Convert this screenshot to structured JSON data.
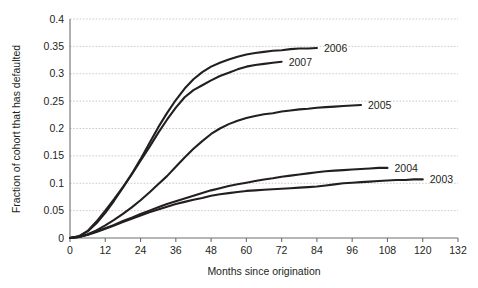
{
  "chart_data": {
    "type": "line",
    "title": "",
    "xlabel": "Months since origination",
    "ylabel": "Fraction of cohort that has defaulted",
    "xlim": [
      0,
      132
    ],
    "ylim": [
      0,
      0.4
    ],
    "xticks": [
      "0",
      "12",
      "24",
      "36",
      "48",
      "60",
      "72",
      "84",
      "96",
      "108",
      "120",
      "132"
    ],
    "yticks": [
      "0",
      "0.05",
      "0.1",
      "0.15",
      "0.2",
      "0.25",
      "0.3",
      "0.35",
      "0.4"
    ],
    "grid": "horizontal-dashed",
    "legend_position": "inline-right-of-line-end",
    "line_color": "#231f20",
    "grid_color": "#bdbdbd",
    "axis_color": "#6d6e71",
    "series": [
      {
        "name": "2003",
        "label": "2003",
        "label_x": 120,
        "label_y": 0.107,
        "x": [
          0,
          3,
          6,
          9,
          12,
          15,
          18,
          21,
          24,
          27,
          30,
          33,
          36,
          39,
          42,
          45,
          48,
          51,
          54,
          57,
          60,
          63,
          66,
          69,
          72,
          75,
          78,
          81,
          84,
          87,
          90,
          93,
          96,
          99,
          102,
          105,
          108,
          111,
          114,
          117,
          120
        ],
        "y": [
          0,
          0.002,
          0.006,
          0.011,
          0.017,
          0.023,
          0.029,
          0.035,
          0.041,
          0.047,
          0.052,
          0.057,
          0.062,
          0.066,
          0.07,
          0.073,
          0.077,
          0.08,
          0.082,
          0.084,
          0.086,
          0.087,
          0.088,
          0.089,
          0.09,
          0.091,
          0.092,
          0.093,
          0.094,
          0.096,
          0.098,
          0.1,
          0.101,
          0.102,
          0.103,
          0.104,
          0.105,
          0.106,
          0.106,
          0.107,
          0.107
        ]
      },
      {
        "name": "2004",
        "label": "2004",
        "label_x": 108,
        "label_y": 0.128,
        "x": [
          0,
          3,
          6,
          9,
          12,
          15,
          18,
          21,
          24,
          27,
          30,
          33,
          36,
          39,
          42,
          45,
          48,
          51,
          54,
          57,
          60,
          63,
          66,
          69,
          72,
          75,
          78,
          81,
          84,
          87,
          90,
          93,
          96,
          99,
          102,
          105,
          108
        ],
        "y": [
          0,
          0.002,
          0.006,
          0.012,
          0.018,
          0.024,
          0.031,
          0.037,
          0.044,
          0.05,
          0.056,
          0.062,
          0.067,
          0.072,
          0.077,
          0.082,
          0.087,
          0.091,
          0.095,
          0.098,
          0.101,
          0.104,
          0.107,
          0.109,
          0.112,
          0.114,
          0.116,
          0.118,
          0.12,
          0.122,
          0.123,
          0.124,
          0.125,
          0.126,
          0.127,
          0.128,
          0.128
        ]
      },
      {
        "name": "2005",
        "label": "2005",
        "label_x": 99,
        "label_y": 0.243,
        "x": [
          0,
          3,
          6,
          9,
          12,
          15,
          18,
          21,
          24,
          27,
          30,
          33,
          36,
          39,
          42,
          45,
          48,
          51,
          54,
          57,
          60,
          63,
          66,
          69,
          72,
          75,
          78,
          81,
          84,
          87,
          90,
          93,
          96,
          99
        ],
        "y": [
          0,
          0.002,
          0.007,
          0.014,
          0.023,
          0.033,
          0.044,
          0.056,
          0.069,
          0.083,
          0.098,
          0.113,
          0.13,
          0.147,
          0.163,
          0.177,
          0.19,
          0.2,
          0.208,
          0.214,
          0.219,
          0.223,
          0.226,
          0.228,
          0.231,
          0.233,
          0.235,
          0.236,
          0.238,
          0.239,
          0.24,
          0.241,
          0.242,
          0.243
        ]
      },
      {
        "name": "2006",
        "label": "2006",
        "label_x": 84,
        "label_y": 0.347,
        "x": [
          0,
          3,
          6,
          9,
          12,
          15,
          18,
          21,
          24,
          27,
          30,
          33,
          36,
          39,
          42,
          45,
          48,
          51,
          54,
          57,
          60,
          63,
          66,
          69,
          72,
          75,
          78,
          81,
          84
        ],
        "y": [
          0,
          0.003,
          0.012,
          0.027,
          0.046,
          0.068,
          0.092,
          0.117,
          0.144,
          0.173,
          0.202,
          0.228,
          0.252,
          0.273,
          0.29,
          0.303,
          0.313,
          0.32,
          0.326,
          0.331,
          0.335,
          0.338,
          0.34,
          0.342,
          0.343,
          0.345,
          0.346,
          0.346,
          0.347
        ]
      },
      {
        "name": "2007",
        "label": "2007",
        "label_x": 72,
        "label_y": 0.322,
        "x": [
          0,
          3,
          6,
          9,
          12,
          15,
          18,
          21,
          24,
          27,
          30,
          33,
          36,
          39,
          42,
          45,
          48,
          51,
          54,
          57,
          60,
          63,
          66,
          69,
          72
        ],
        "y": [
          0,
          0.003,
          0.013,
          0.03,
          0.05,
          0.071,
          0.093,
          0.116,
          0.141,
          0.166,
          0.192,
          0.216,
          0.238,
          0.257,
          0.27,
          0.279,
          0.288,
          0.296,
          0.302,
          0.308,
          0.313,
          0.316,
          0.318,
          0.32,
          0.322
        ]
      }
    ]
  }
}
